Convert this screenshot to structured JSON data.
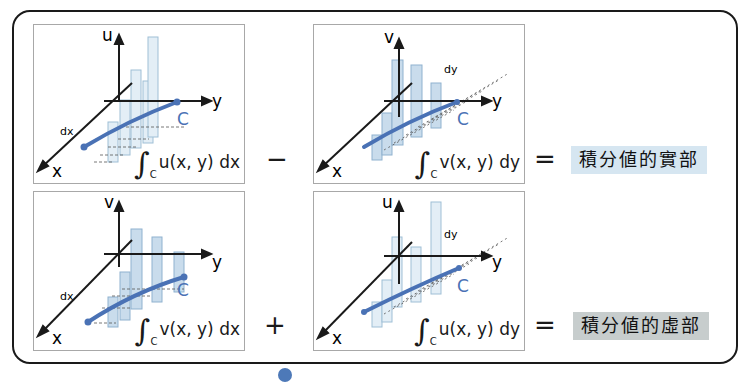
{
  "colors": {
    "curve": "#4a72b5",
    "bar_fill": "#c9dcec",
    "bar_fill_light": "#e3eef6",
    "real_box": "#d6e6f1",
    "imag_box": "#c7cdcd",
    "axis": "#1a1a1a"
  },
  "panels": [
    {
      "id": "top-left",
      "vertical_axis": "u",
      "horizontal_axis": "y",
      "depth_axis": "x",
      "curve_label": "C",
      "differential_label": "dx",
      "integral": {
        "sign": "∫",
        "subscript": "C",
        "integrand": "u(x, y) dx"
      }
    },
    {
      "id": "top-right",
      "vertical_axis": "v",
      "horizontal_axis": "y",
      "depth_axis": "x",
      "curve_label": "C",
      "differential_label": "dy",
      "integral": {
        "sign": "∫",
        "subscript": "C",
        "integrand": "v(x, y) dy"
      }
    },
    {
      "id": "bottom-left",
      "vertical_axis": "v",
      "horizontal_axis": "y",
      "depth_axis": "x",
      "curve_label": "C",
      "differential_label": "dx",
      "integral": {
        "sign": "∫",
        "subscript": "C",
        "integrand": "v(x, y) dx"
      }
    },
    {
      "id": "bottom-right",
      "vertical_axis": "u",
      "horizontal_axis": "y",
      "depth_axis": "x",
      "curve_label": "C",
      "differential_label": "dy",
      "integral": {
        "sign": "∫",
        "subscript": "C",
        "integrand": "u(x, y) dy"
      }
    }
  ],
  "operators": {
    "top": "−",
    "bottom": "+",
    "equals_top": "=",
    "equals_bottom": "="
  },
  "results": {
    "real_part": "積分値的實部",
    "imaginary_part": "積分値的虛部"
  }
}
